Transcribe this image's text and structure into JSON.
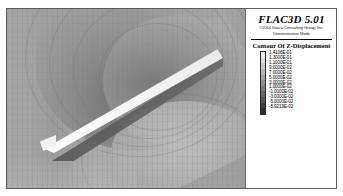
{
  "window": {
    "background_color": "#ffffff",
    "border_color": "#5c5c5c"
  },
  "legend": {
    "app_title": "FLAC3D 5.01",
    "copyright": "©2014 Itasca Consulting Group, Inc.",
    "mode": "Demonstration Mode",
    "contour_title": "Contour Of Z-Displacement",
    "colorbar": {
      "orientation": "vertical",
      "colormap": "grayscale",
      "top_color": "#f2f2f2",
      "bottom_color": "#1a1a1a"
    },
    "values": [
      "1.4106E-01",
      "1.3000E-01",
      "1.1000E-01",
      "9.0000E-02",
      "7.0000E-02",
      "5.0000E-02",
      "3.0000E-02",
      "1.0000E-02",
      "-1.0000E-02",
      "-3.0000E-02",
      "-5.0000E-02",
      "-5.9219E-02"
    ],
    "swatch_colors": [
      "#efefef",
      "#dedede",
      "#cacaca",
      "#b6b6b6",
      "#a2a2a2",
      "#8e8e8e",
      "#7a7a7a",
      "#666666",
      "#525252",
      "#3e3e3e",
      "#2a2a2a"
    ]
  },
  "viewport": {
    "name": "3d-model-view",
    "description": "Grayscale Z-displacement contour field on a meshed soil block with a white diagonal cut-plane slab"
  },
  "chart_data": {
    "type": "heatmap",
    "title": "Contour Of Z-Displacement",
    "subtitle": "FLAC3D 5.01 — Demonstration Mode",
    "colormap": "grayscale",
    "legend_position": "right",
    "grid": true,
    "units": "m",
    "variable": "Z-Displacement",
    "zlim": [
      -0.059219,
      0.14106
    ],
    "contour_levels": [
      0.14106,
      0.13,
      0.11,
      0.09,
      0.07,
      0.05,
      0.03,
      0.01,
      -0.01,
      -0.03,
      -0.05,
      -0.059219
    ],
    "tick_labels": [
      "1.4106E-01",
      "1.3000E-01",
      "1.1000E-01",
      "9.0000E-02",
      "7.0000E-02",
      "5.0000E-02",
      "3.0000E-02",
      "1.0000E-02",
      "-1.0000E-02",
      "-3.0000E-02",
      "-5.0000E-02",
      "-5.9219E-02"
    ],
    "xlabel": "",
    "ylabel": ""
  }
}
